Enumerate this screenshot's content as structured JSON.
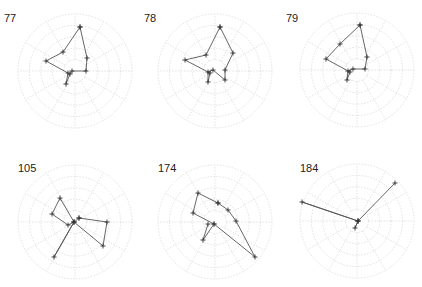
{
  "chart_data": [
    {
      "type": "radar",
      "title": "77",
      "center": [
        75,
        71
      ],
      "radius": 57,
      "rings": 5,
      "spokes": 12,
      "path": [
        [
          5,
          -44
        ],
        [
          12,
          -13
        ],
        [
          11,
          0
        ],
        [
          -3,
          0
        ],
        [
          -5,
          3
        ],
        [
          -9,
          13
        ],
        [
          -7,
          2
        ],
        [
          -29,
          -10
        ],
        [
          -12,
          -19
        ],
        [
          5,
          -44
        ]
      ]
    },
    {
      "type": "radar",
      "title": "78",
      "center": [
        215,
        71
      ],
      "radius": 57,
      "rings": 5,
      "spokes": 12,
      "path": [
        [
          5,
          -44
        ],
        [
          18,
          -18
        ],
        [
          10,
          -1
        ],
        [
          10,
          9
        ],
        [
          -2,
          -1
        ],
        [
          -7,
          1
        ],
        [
          -7,
          11
        ],
        [
          -5,
          2
        ],
        [
          -30,
          -11
        ],
        [
          -9,
          -16
        ],
        [
          5,
          -44
        ]
      ]
    },
    {
      "type": "radar",
      "title": "79",
      "center": [
        357,
        70
      ],
      "radius": 57,
      "rings": 5,
      "spokes": 12,
      "path": [
        [
          3,
          -45
        ],
        [
          10,
          -13
        ],
        [
          8,
          -1
        ],
        [
          -4,
          -1
        ],
        [
          -9,
          1
        ],
        [
          -10,
          10
        ],
        [
          -7,
          2
        ],
        [
          -31,
          -11
        ],
        [
          -17,
          -26
        ],
        [
          3,
          -45
        ]
      ]
    },
    {
      "type": "radar",
      "title": "105",
      "center": [
        75,
        222
      ],
      "radius": 57,
      "rings": 5,
      "spokes": 12,
      "path": [
        [
          4,
          -4
        ],
        [
          32,
          0
        ],
        [
          28,
          24
        ],
        [
          -1,
          0
        ],
        [
          -15,
          -24
        ],
        [
          -23,
          -8
        ],
        [
          -7,
          3
        ],
        [
          -1,
          0
        ],
        [
          -21,
          35
        ],
        [
          -1,
          0
        ],
        [
          4,
          -4
        ]
      ]
    },
    {
      "type": "radar",
      "title": "174",
      "center": [
        215,
        222
      ],
      "radius": 57,
      "rings": 5,
      "spokes": 12,
      "path": [
        [
          3,
          -19
        ],
        [
          13,
          -12
        ],
        [
          21,
          -1
        ],
        [
          40,
          35
        ],
        [
          -1,
          2
        ],
        [
          -22,
          -9
        ],
        [
          -17,
          -29
        ],
        [
          3,
          -19
        ]
      ],
      "extra_path": [
        [
          -7,
          2
        ],
        [
          -12,
          18
        ],
        [
          -1,
          2
        ]
      ]
    },
    {
      "type": "radar",
      "title": "184",
      "center": [
        357,
        221
      ],
      "radius": 57,
      "rings": 5,
      "spokes": 12,
      "path": [
        [
          38,
          -38
        ],
        [
          1,
          0
        ],
        [
          -55,
          -19
        ],
        [
          1,
          0
        ],
        [
          -2,
          7
        ],
        [
          1,
          0
        ]
      ]
    }
  ],
  "colors": {
    "grid": "#d9d9d9",
    "line": "#555555",
    "marker": "#333333",
    "label": "#222222"
  }
}
